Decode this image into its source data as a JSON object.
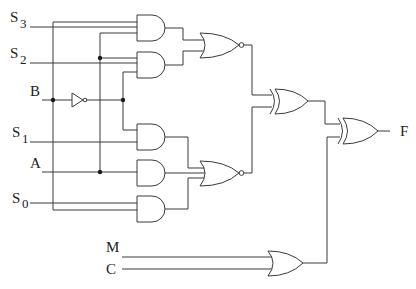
{
  "diagram": {
    "type": "logic-circuit",
    "inputs": [
      {
        "name": "S",
        "sub": "3"
      },
      {
        "name": "S",
        "sub": "2"
      },
      {
        "name": "B",
        "sub": ""
      },
      {
        "name": "S",
        "sub": "1"
      },
      {
        "name": "A",
        "sub": ""
      },
      {
        "name": "S",
        "sub": "0"
      },
      {
        "name": "M",
        "sub": ""
      },
      {
        "name": "C",
        "sub": ""
      }
    ],
    "output": {
      "name": "F"
    },
    "gates": [
      {
        "id": "not-b",
        "type": "NOT",
        "inputs": [
          "B"
        ]
      },
      {
        "id": "and1",
        "type": "AND",
        "inputs": [
          "S3",
          "B",
          "A"
        ]
      },
      {
        "id": "and2",
        "type": "AND",
        "inputs": [
          "S2",
          "A",
          "B'"
        ]
      },
      {
        "id": "nor1",
        "type": "NOR",
        "inputs": [
          "and1",
          "and2"
        ]
      },
      {
        "id": "and3",
        "type": "AND",
        "inputs": [
          "B'",
          "S1"
        ]
      },
      {
        "id": "and4",
        "type": "AND",
        "inputs": [
          "A"
        ]
      },
      {
        "id": "and5",
        "type": "AND",
        "inputs": [
          "S0",
          "B"
        ]
      },
      {
        "id": "nor2",
        "type": "NOR",
        "inputs": [
          "and3",
          "and4",
          "and5"
        ]
      },
      {
        "id": "xor1",
        "type": "XOR",
        "inputs": [
          "nor1",
          "nor2"
        ]
      },
      {
        "id": "or1",
        "type": "OR",
        "inputs": [
          "M",
          "C"
        ]
      },
      {
        "id": "xor2",
        "type": "XOR",
        "inputs": [
          "xor1",
          "or1"
        ]
      }
    ]
  }
}
